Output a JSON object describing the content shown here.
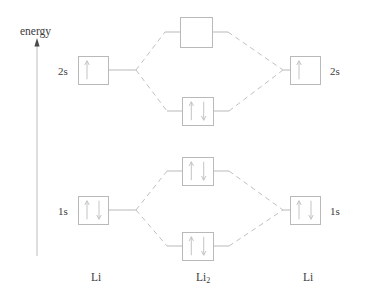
{
  "diagram": {
    "type": "molecular-orbital-energy-level-diagram",
    "molecule": "Li2",
    "axis": {
      "label": "energy",
      "direction": "up"
    },
    "colors": {
      "box_stroke": "#b9b9b9",
      "line_stroke": "#b9b9b9",
      "dashed_stroke": "#c0c0c0",
      "arrow_stroke": "#c4c4c4",
      "text": "#3b3b3b",
      "axis_stroke": "#bdbdbd",
      "background": "#ffffff"
    },
    "column_labels": [
      {
        "name": "left-atom",
        "text": "Li",
        "x": 91,
        "y": 272
      },
      {
        "name": "molecule",
        "text": "Li",
        "sub": "2",
        "x": 196,
        "y": 272
      },
      {
        "name": "right-atom",
        "text": "Li",
        "x": 303,
        "y": 272
      }
    ],
    "orbital_labels": [
      {
        "name": "left-2s-label",
        "text": "2s",
        "x": 58,
        "y": 66
      },
      {
        "name": "right-2s-label",
        "text": "2s",
        "x": 330,
        "y": 66
      },
      {
        "name": "left-1s-label",
        "text": "1s",
        "x": 58,
        "y": 206
      },
      {
        "name": "right-1s-label",
        "text": "1s",
        "x": 330,
        "y": 206
      }
    ],
    "levels": [
      {
        "name": "left-2s-orbital",
        "kind": "atomic",
        "side": "left",
        "shell": "2s",
        "x": 78,
        "y": 56,
        "w": 30,
        "h": 28,
        "electrons": 1
      },
      {
        "name": "sigma-star-2s-orbital",
        "kind": "molecular",
        "side": "center",
        "shell": "2s",
        "x": 180,
        "y": 17,
        "w": 32,
        "h": 30,
        "electrons": 0
      },
      {
        "name": "sigma-2s-orbital",
        "kind": "molecular",
        "side": "center",
        "shell": "2s",
        "x": 182,
        "y": 97,
        "w": 31,
        "h": 28,
        "electrons": 2
      },
      {
        "name": "right-2s-orbital",
        "kind": "atomic",
        "side": "right",
        "shell": "2s",
        "x": 290,
        "y": 56,
        "w": 30,
        "h": 28,
        "electrons": 1
      },
      {
        "name": "left-1s-orbital",
        "kind": "atomic",
        "side": "left",
        "shell": "1s",
        "x": 78,
        "y": 196,
        "w": 30,
        "h": 28,
        "electrons": 2
      },
      {
        "name": "sigma-star-1s-orbital",
        "kind": "molecular",
        "side": "center",
        "shell": "1s",
        "x": 182,
        "y": 157,
        "w": 31,
        "h": 28,
        "electrons": 2
      },
      {
        "name": "sigma-1s-orbital",
        "kind": "molecular",
        "side": "center",
        "shell": "1s",
        "x": 182,
        "y": 232,
        "w": 31,
        "h": 28,
        "electrons": 2
      },
      {
        "name": "right-1s-orbital",
        "kind": "atomic",
        "side": "right",
        "shell": "1s",
        "x": 290,
        "y": 196,
        "w": 30,
        "h": 28,
        "electrons": 2
      }
    ],
    "energy_axis": {
      "x": 37,
      "y_top": 38,
      "y_bottom": 256
    },
    "solid_connectors": [
      {
        "name": "left-2s-stem",
        "x1": 108,
        "y1": 70,
        "x2": 136,
        "y2": 70
      },
      {
        "name": "right-2s-stem",
        "x1": 283,
        "y1": 70,
        "x2": 290,
        "y2": 70
      },
      {
        "name": "left-1s-stem",
        "x1": 108,
        "y1": 210,
        "x2": 136,
        "y2": 210
      },
      {
        "name": "right-1s-stem",
        "x1": 283,
        "y1": 210,
        "x2": 290,
        "y2": 210
      },
      {
        "name": "sigma-star-2s-left-stem",
        "x1": 165,
        "y1": 32,
        "x2": 180,
        "y2": 32
      },
      {
        "name": "sigma-star-2s-right-stem",
        "x1": 212,
        "y1": 32,
        "x2": 228,
        "y2": 32
      },
      {
        "name": "sigma-2s-left-stem",
        "x1": 167,
        "y1": 111,
        "x2": 182,
        "y2": 111
      },
      {
        "name": "sigma-2s-right-stem",
        "x1": 213,
        "y1": 111,
        "x2": 229,
        "y2": 111
      },
      {
        "name": "sigma-star-1s-left-stem",
        "x1": 167,
        "y1": 171,
        "x2": 182,
        "y2": 171
      },
      {
        "name": "sigma-star-1s-right-stem",
        "x1": 213,
        "y1": 171,
        "x2": 229,
        "y2": 171
      },
      {
        "name": "sigma-1s-left-stem",
        "x1": 167,
        "y1": 246,
        "x2": 182,
        "y2": 246
      },
      {
        "name": "sigma-1s-right-stem",
        "x1": 213,
        "y1": 246,
        "x2": 229,
        "y2": 246
      }
    ],
    "dashed_correlations": [
      {
        "name": "left-2s-to-sigma-star-2s",
        "x1": 136,
        "y1": 70,
        "x2": 165,
        "y2": 32
      },
      {
        "name": "left-2s-to-sigma-2s",
        "x1": 136,
        "y1": 70,
        "x2": 167,
        "y2": 111
      },
      {
        "name": "sigma-star-2s-to-right-2s",
        "x1": 228,
        "y1": 32,
        "x2": 283,
        "y2": 70
      },
      {
        "name": "sigma-2s-to-right-2s",
        "x1": 229,
        "y1": 111,
        "x2": 283,
        "y2": 70
      },
      {
        "name": "left-1s-to-sigma-star-1s",
        "x1": 136,
        "y1": 210,
        "x2": 167,
        "y2": 171
      },
      {
        "name": "left-1s-to-sigma-1s",
        "x1": 136,
        "y1": 210,
        "x2": 167,
        "y2": 246
      },
      {
        "name": "sigma-star-1s-to-right-1s",
        "x1": 229,
        "y1": 171,
        "x2": 283,
        "y2": 210
      },
      {
        "name": "sigma-1s-to-right-1s",
        "x1": 229,
        "y1": 246,
        "x2": 283,
        "y2": 210
      }
    ]
  }
}
